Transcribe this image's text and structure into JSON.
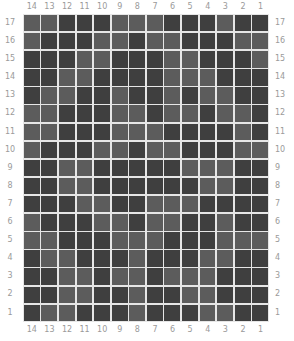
{
  "columns": [
    "14",
    "13",
    "12",
    "11",
    "10",
    "9",
    "8",
    "7",
    "6",
    "5",
    "4",
    "3",
    "2",
    "1"
  ],
  "rows": [
    "17",
    "16",
    "15",
    "14",
    "13",
    "12",
    "11",
    "10",
    "9",
    "8",
    "7",
    "6",
    "5",
    "4",
    "3",
    "2",
    "1"
  ],
  "colors": {
    "light": "#5c5c5c",
    "dark": "#3f3f3f",
    "gap": "#e6e6e6",
    "label": "#9a9a9a"
  },
  "cells": [
    "LLDDDLLLDDDLDD",
    "LDDDLLDLLDDDLL",
    "DDDLLDDDLLDDDL",
    "DDLLDDDDLLLDDD",
    "DLLDDLDDLDLLDD",
    "LLDDDLLDLLDLLD",
    "LLDDDLLLDDDDLD",
    "LDDDLLDLLDDDLL",
    "DDLLDDDDDLLLDD",
    "DDLLDDDDDDLLDD",
    "DDDLLDDLLLDDDD",
    "LDDDLLDLLDDLDD",
    "LLDDDLLLDDDLLL",
    "DLLDDDLDDDLLDD",
    "DDLLDLLDLLLDDD",
    "DDLLDDLDDLLDDD",
    "DLLDDDLDDDLLDD"
  ]
}
